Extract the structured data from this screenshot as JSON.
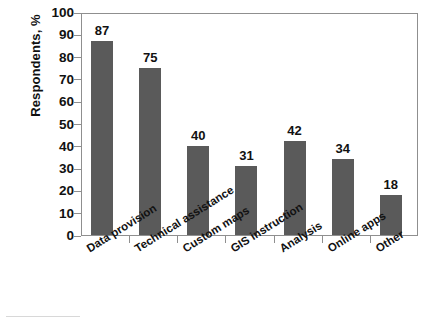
{
  "chart_data": {
    "type": "bar",
    "title": "",
    "xlabel": "",
    "ylabel": "Respondents, %",
    "categories": [
      "Data provision",
      "Technical assistance",
      "Custom maps",
      "GIS instruction",
      "Analysis",
      "Online apps",
      "Other"
    ],
    "values": [
      87,
      75,
      40,
      31,
      42,
      34,
      18
    ],
    "value_labels": [
      "87",
      "75",
      "40",
      "31",
      "42",
      "34",
      "18"
    ],
    "ylim": [
      0,
      100
    ],
    "ytick_labels": [
      "100",
      "90",
      "80",
      "70",
      "60",
      "50",
      "40",
      "30",
      "20",
      "10",
      "0"
    ],
    "ytick_values": [
      100,
      90,
      80,
      70,
      60,
      50,
      40,
      30,
      20,
      10,
      0
    ],
    "grid": false,
    "legend": null,
    "bar_color": "#5a5a5a",
    "axis_color": "#8f8f8f",
    "text_color": "#111111",
    "background": "#ffffff"
  }
}
